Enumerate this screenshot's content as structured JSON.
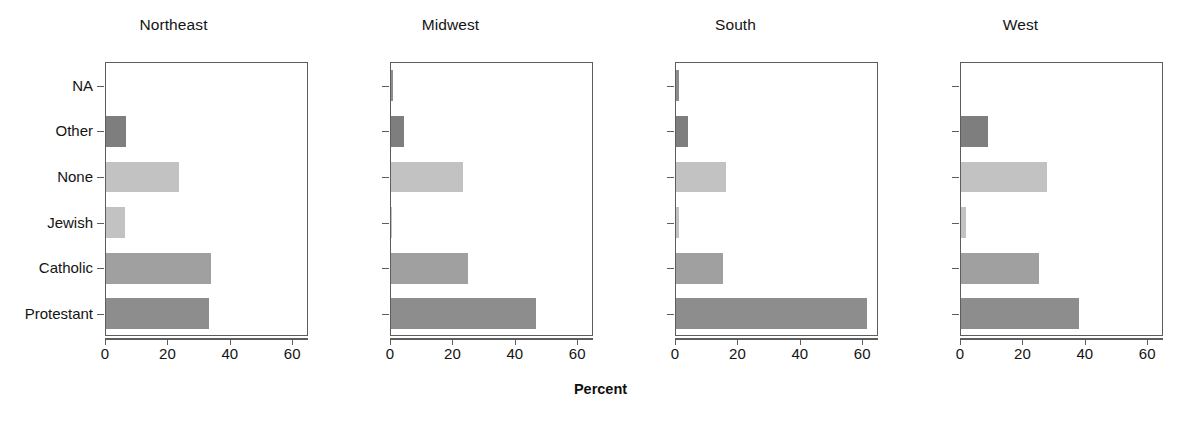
{
  "chart_data": {
    "type": "bar",
    "orientation": "horizontal",
    "title": "",
    "subtitle": "",
    "xlabel": "Percent",
    "ylabel": "",
    "xlim": [
      0,
      65
    ],
    "xticks": [
      0,
      20,
      40,
      60
    ],
    "xtick_labels": [
      "0",
      "20",
      "40",
      "60"
    ],
    "grid": false,
    "legend": null,
    "categories": [
      "Protestant",
      "Catholic",
      "Jewish",
      "None",
      "Other",
      "NA"
    ],
    "panel_label": "Region",
    "panels": [
      {
        "name": "Northeast",
        "values": [
          33.0,
          33.7,
          6.2,
          23.4,
          6.4,
          0.0
        ]
      },
      {
        "name": "Midwest",
        "values": [
          46.5,
          24.5,
          0.2,
          23.0,
          4.1,
          0.7
        ]
      },
      {
        "name": "South",
        "values": [
          61.0,
          15.0,
          1.0,
          16.0,
          4.0,
          1.0
        ]
      },
      {
        "name": "West",
        "values": [
          37.8,
          25.0,
          1.5,
          27.5,
          8.5,
          0.0
        ]
      }
    ],
    "bar_colors": {
      "Protestant": "#8d8d8d",
      "Catholic": "#a0a0a0",
      "Jewish": "#c2c2c2",
      "None": "#c2c2c2",
      "Other": "#7e7e7e",
      "NA": "#8d8d8d"
    },
    "frame_color": "#5d5d5d",
    "text_color": "#141414"
  },
  "yaxis": {
    "labels": [
      "NA",
      "Other",
      "None",
      "Jewish",
      "Catholic",
      "Protestant"
    ]
  },
  "xaxis": {
    "title": "Percent",
    "ticks": [
      "0",
      "20",
      "40",
      "60"
    ]
  },
  "panel_titles": {
    "p0": "Northeast",
    "p1": "Midwest",
    "p2": "South",
    "p3": "West"
  }
}
